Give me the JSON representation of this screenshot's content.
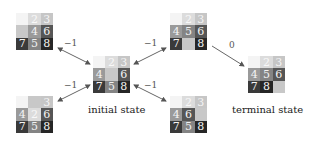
{
  "diagram": {
    "tile_colors": {
      "1": {
        "bg": "#f4f4f4",
        "fg": "#f4f4f4"
      },
      "2": {
        "bg": "#dcdcdc",
        "fg": "#f8f8f8"
      },
      "3": {
        "bg": "#c6c6c6",
        "fg": "#f4f4f4"
      },
      "4": {
        "bg": "#9a9a9a",
        "fg": "#f4f4f4"
      },
      "5": {
        "bg": "#848484",
        "fg": "#f0f0f0"
      },
      "6": {
        "bg": "#565656",
        "fg": "#f4f4f4"
      },
      "7": {
        "bg": "#3a3a3a",
        "fg": "#f4f4f4"
      },
      "8": {
        "bg": "#262626",
        "fg": "#f4f4f4"
      },
      "empty": {
        "bg": "#c8c8c8",
        "fg": "#c8c8c8"
      }
    },
    "states": [
      {
        "id": "top-left",
        "x": 16,
        "y": 13,
        "tiles": [
          "1",
          "2",
          "3",
          "",
          "4",
          "6",
          "7",
          "5",
          "8"
        ]
      },
      {
        "id": "initial",
        "x": 93,
        "y": 56,
        "tiles": [
          "1",
          "2",
          "3",
          "4",
          "",
          "6",
          "7",
          "5",
          "8"
        ],
        "label": "initial state"
      },
      {
        "id": "top-center",
        "x": 170,
        "y": 13,
        "tiles": [
          "1",
          "2",
          "3",
          "4",
          "5",
          "6",
          "7",
          "",
          "8"
        ]
      },
      {
        "id": "terminal",
        "x": 248,
        "y": 56,
        "tiles": [
          "1",
          "2",
          "3",
          "4",
          "5",
          "6",
          "7",
          "8",
          ""
        ],
        "label": "terminal state"
      },
      {
        "id": "bottom-left",
        "x": 16,
        "y": 96,
        "tiles": [
          "1",
          "",
          "3",
          "4",
          "2",
          "6",
          "7",
          "5",
          "8"
        ]
      },
      {
        "id": "bottom-center",
        "x": 170,
        "y": 96,
        "tiles": [
          "1",
          "2",
          "3",
          "4",
          "6",
          "",
          "7",
          "5",
          "8"
        ]
      }
    ],
    "edges": [
      {
        "from": "initial",
        "to": "top-left",
        "label": "−1",
        "bidirectional": true
      },
      {
        "from": "initial",
        "to": "top-center",
        "label": "−1",
        "bidirectional": true
      },
      {
        "from": "initial",
        "to": "bottom-left",
        "label": "−1",
        "bidirectional": true
      },
      {
        "from": "initial",
        "to": "bottom-center",
        "label": "−1",
        "bidirectional": true
      },
      {
        "from": "top-center",
        "to": "terminal",
        "label": "0",
        "bidirectional": false
      }
    ]
  }
}
